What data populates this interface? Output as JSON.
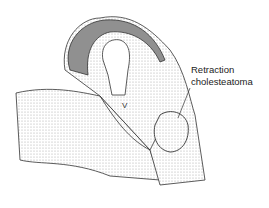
{
  "figure": {
    "annotation": {
      "line1": "Retraction",
      "line2": "cholesteatoma"
    },
    "structure_letter": "V",
    "colors": {
      "ink": "#222222",
      "stipple_dark": "#6a6a6a",
      "stipple_light": "#c8c8c8",
      "background": "#ffffff"
    }
  }
}
